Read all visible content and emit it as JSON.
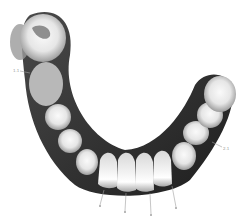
{
  "diagram": {
    "colors": {
      "background": "#ffffff",
      "gum_dark": "#2a2a2a",
      "tooth_light": "#f2f2f2",
      "tooth_mid": "#bdbdbd",
      "tooth_shadow": "#8a8a8a",
      "leader": "#a0a0a0"
    },
    "labels": [
      {
        "id": "left-label",
        "text": "1.1"
      },
      {
        "id": "right-label",
        "text": "2.1"
      },
      {
        "id": "incisor-label-1",
        "text": ""
      },
      {
        "id": "incisor-label-2",
        "text": ""
      },
      {
        "id": "incisor-label-3",
        "text": ""
      },
      {
        "id": "incisor-label-4",
        "text": ""
      }
    ]
  }
}
